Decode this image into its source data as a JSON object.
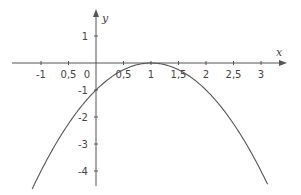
{
  "chart_data": {
    "type": "line",
    "title": "",
    "function": "y = -(x - 1)^2",
    "xlabel": "x",
    "ylabel": "y",
    "xlim": [
      -1.16,
      3.12
    ],
    "ylim": [
      -4.7,
      1.6
    ],
    "grid": false,
    "legend": "none",
    "x_ticks": [
      {
        "value": -1,
        "label": "-1"
      },
      {
        "value": -0.5,
        "label": "0,5"
      },
      {
        "value": 0.5,
        "label": "0,5"
      },
      {
        "value": 1,
        "label": "1"
      },
      {
        "value": 1.5,
        "label": "1,5"
      },
      {
        "value": 2,
        "label": "2"
      },
      {
        "value": 2.5,
        "label": "2,5"
      },
      {
        "value": 3,
        "label": "3"
      }
    ],
    "origin_label": "0",
    "y_ticks": [
      {
        "value": 1,
        "label": "1"
      },
      {
        "value": -1,
        "label": "-1"
      },
      {
        "value": -2,
        "label": "-2"
      },
      {
        "value": -3,
        "label": "-3"
      },
      {
        "value": -4,
        "label": "-4"
      }
    ],
    "series": [
      {
        "name": "parabola",
        "x": [
          -1.16,
          -1,
          -0.5,
          0,
          0.5,
          1,
          1.5,
          2,
          2.5,
          3,
          3.12
        ],
        "y": [
          -4.67,
          -4,
          -2.25,
          -1,
          -0.25,
          0,
          -0.25,
          -1,
          -2.25,
          -4,
          -4.49
        ]
      }
    ],
    "colors": {
      "axis": "#555555",
      "curve": "#555555",
      "text": "#444444"
    }
  }
}
